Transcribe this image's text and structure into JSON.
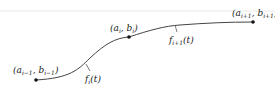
{
  "diagram": {
    "points": [
      {
        "id": "p_prev",
        "label_main": "(a",
        "sub_a": "i−1",
        "mid": ", b",
        "sub_b": "i−1",
        "close": ")",
        "x": 36,
        "y": 80
      },
      {
        "id": "p_cur",
        "label_main": "(a",
        "sub_a": "i",
        "mid": ", b",
        "sub_b": "i",
        "close": ")",
        "x": 129,
        "y": 37
      },
      {
        "id": "p_next",
        "label_main": "(a",
        "sub_a": "i+1",
        "mid": ", b",
        "sub_b": "i+1",
        "close": ")",
        "x": 253,
        "y": 22
      }
    ],
    "curves": [
      {
        "id": "f_i",
        "name": "f",
        "sub": "i",
        "arg": "(t)"
      },
      {
        "id": "f_i1",
        "name": "f",
        "sub": "i+1",
        "arg": "(t)"
      }
    ],
    "colors": {
      "curve": "#444444",
      "point": "#111111",
      "topline": "#e6e6e6"
    }
  }
}
